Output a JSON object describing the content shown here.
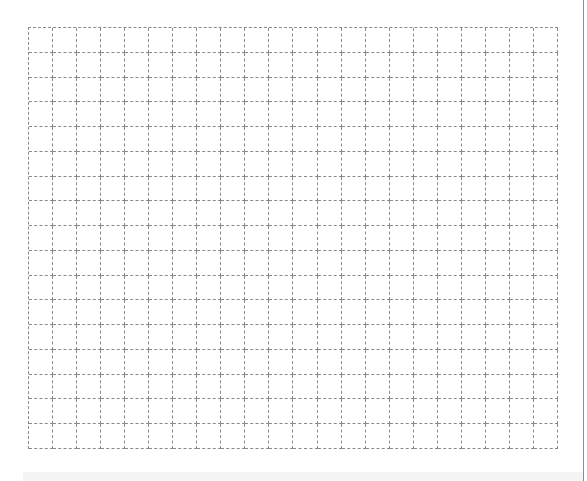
{
  "grid": {
    "columns": 22,
    "rows": 17,
    "line_style": "dashed",
    "line_color": "#8a8a8a",
    "background": "#ffffff"
  },
  "page": {
    "right_rule_color": "#8c8c8c",
    "bottom_band_color": "#f4f4f4"
  }
}
